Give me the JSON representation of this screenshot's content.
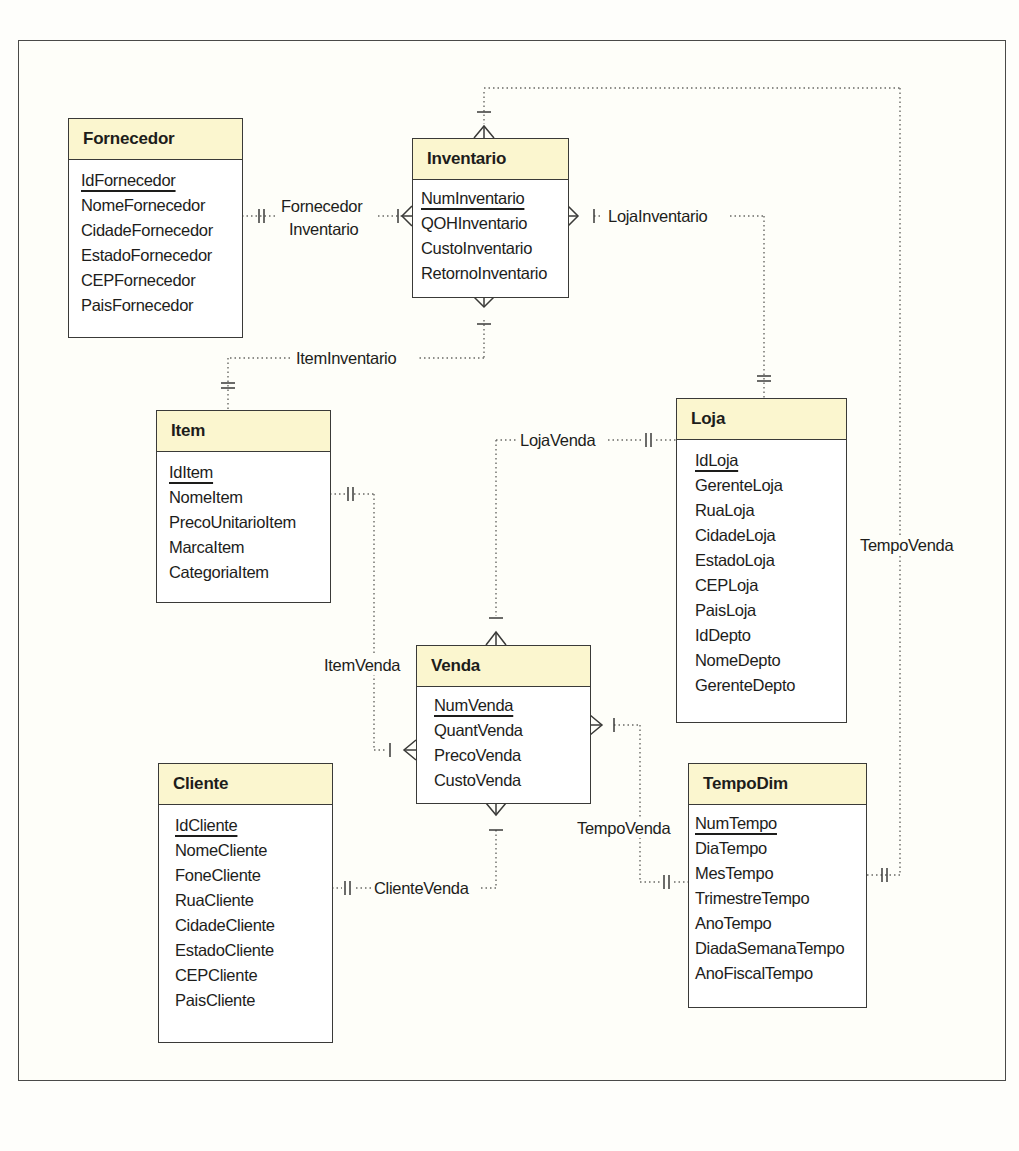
{
  "diagram": {
    "type": "entity-relationship (crow's foot)",
    "entities": [
      {
        "id": "fornecedor",
        "name": "Fornecedor",
        "attributes": [
          {
            "name": "IdFornecedor",
            "pk": true
          },
          {
            "name": "NomeFornecedor"
          },
          {
            "name": "CidadeFornecedor"
          },
          {
            "name": "EstadoFornecedor"
          },
          {
            "name": "CEPFornecedor"
          },
          {
            "name": "PaisFornecedor"
          }
        ]
      },
      {
        "id": "inventario",
        "name": "Inventario",
        "attributes": [
          {
            "name": "NumInventario",
            "pk": true
          },
          {
            "name": "QOHInventario"
          },
          {
            "name": "CustoInventario"
          },
          {
            "name": "RetornoInventario"
          }
        ]
      },
      {
        "id": "item",
        "name": "Item",
        "attributes": [
          {
            "name": "IdItem",
            "pk": true
          },
          {
            "name": "NomeItem"
          },
          {
            "name": "PrecoUnitarioItem"
          },
          {
            "name": "MarcaItem"
          },
          {
            "name": "CategoriaItem"
          }
        ]
      },
      {
        "id": "loja",
        "name": "Loja",
        "attributes": [
          {
            "name": "IdLoja",
            "pk": true
          },
          {
            "name": "GerenteLoja"
          },
          {
            "name": "RuaLoja"
          },
          {
            "name": "CidadeLoja"
          },
          {
            "name": "EstadoLoja"
          },
          {
            "name": "CEPLoja"
          },
          {
            "name": "PaisLoja"
          },
          {
            "name": "IdDepto"
          },
          {
            "name": "NomeDepto"
          },
          {
            "name": "GerenteDepto"
          }
        ]
      },
      {
        "id": "venda",
        "name": "Venda",
        "attributes": [
          {
            "name": "NumVenda",
            "pk": true
          },
          {
            "name": "QuantVenda"
          },
          {
            "name": "PrecoVenda"
          },
          {
            "name": "CustoVenda"
          }
        ]
      },
      {
        "id": "cliente",
        "name": "Cliente",
        "attributes": [
          {
            "name": "IdCliente",
            "pk": true
          },
          {
            "name": "NomeCliente"
          },
          {
            "name": "FoneCliente"
          },
          {
            "name": "RuaCliente"
          },
          {
            "name": "CidadeCliente"
          },
          {
            "name": "EstadoCliente"
          },
          {
            "name": "CEPCliente"
          },
          {
            "name": "PaisCliente"
          }
        ]
      },
      {
        "id": "tempodim",
        "name": "TempoDim",
        "attributes": [
          {
            "name": "NumTempo",
            "pk": true
          },
          {
            "name": "DiaTempo"
          },
          {
            "name": "MesTempo"
          },
          {
            "name": "TrimestreTempo"
          },
          {
            "name": "AnoTempo"
          },
          {
            "name": "DiadaSemanaTempo"
          },
          {
            "name": "AnoFiscalTempo"
          }
        ]
      }
    ],
    "relationships": [
      {
        "name_line1": "Fornecedor",
        "name_line2": "Inventario",
        "from": "Fornecedor",
        "from_card": "exactly-one",
        "to": "Inventario",
        "to_card": "one-or-many"
      },
      {
        "name": "LojaInventario",
        "from": "Loja",
        "from_card": "exactly-one",
        "to": "Inventario",
        "to_card": "one-or-many"
      },
      {
        "name": "ItemInventario",
        "from": "Item",
        "from_card": "exactly-one",
        "to": "Inventario",
        "to_card": "one-or-many"
      },
      {
        "name": "TempoVenda",
        "from": "TempoDim",
        "from_card": "exactly-one",
        "to": "Inventario",
        "to_card": "one-or-many",
        "note": "top loop connector"
      },
      {
        "name": "LojaVenda",
        "from": "Loja",
        "from_card": "exactly-one",
        "to": "Venda",
        "to_card": "one-or-many"
      },
      {
        "name": "ItemVenda",
        "from": "Item",
        "from_card": "exactly-one",
        "to": "Venda",
        "to_card": "one-or-many"
      },
      {
        "name": "ClienteVenda",
        "from": "Cliente",
        "from_card": "exactly-one",
        "to": "Venda",
        "to_card": "one-or-many"
      },
      {
        "name": "TempoVenda",
        "from": "TempoDim",
        "from_card": "exactly-one",
        "to": "Venda",
        "to_card": "one-or-many"
      }
    ],
    "colors": {
      "header_fill": "#fbf6cf",
      "box_border": "#3a3a38",
      "background": "#fefef9",
      "connector": "#6a6a66"
    }
  },
  "labels": {
    "fornecedor_inventario_1": "Fornecedor",
    "fornecedor_inventario_2": "Inventario",
    "loja_inventario": "LojaInventario",
    "item_inventario": "ItemInventario",
    "tempo_venda_right": "TempoVenda",
    "loja_venda": "LojaVenda",
    "item_venda": "ItemVenda",
    "cliente_venda": "ClienteVenda",
    "tempo_venda_left": "TempoVenda"
  }
}
